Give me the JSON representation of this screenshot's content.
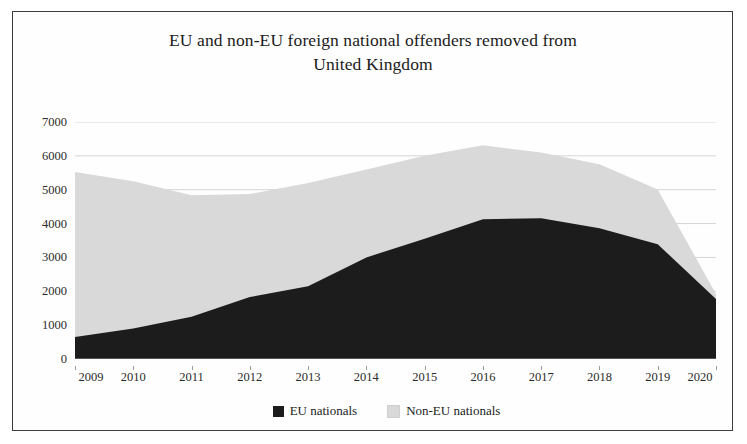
{
  "chart_data": {
    "type": "area",
    "stacked": true,
    "title": "EU and non-EU foreign national offenders removed from United Kingdom",
    "title_lines": [
      "EU and non-EU foreign national offenders removed from",
      "United Kingdom"
    ],
    "xlabel": "",
    "ylabel": "",
    "categories": [
      "2009",
      "2010",
      "2011",
      "2012",
      "2013",
      "2014",
      "2015",
      "2016",
      "2017",
      "2018",
      "2019",
      "2020"
    ],
    "x_tick_labels": [
      "2009",
      "2010",
      "2011",
      "2012",
      "2013",
      "2014",
      "2015",
      "2016",
      "2017",
      "2018",
      "2019",
      "2020"
    ],
    "y_tick_labels": [
      "0",
      "1000",
      "2000",
      "3000",
      "4000",
      "5000",
      "6000",
      "7000"
    ],
    "y_ticks": [
      0,
      1000,
      2000,
      3000,
      4000,
      5000,
      6000,
      7000
    ],
    "ylim": [
      0,
      7000
    ],
    "grid": true,
    "grid_axis": "y",
    "legend_position": "bottom",
    "series": [
      {
        "name": "EU nationals",
        "color": "#1c1c1c",
        "values": [
          650,
          900,
          1250,
          1830,
          2150,
          3000,
          3550,
          4130,
          4160,
          3860,
          3390,
          1770
        ]
      },
      {
        "name": "Non-EU nationals",
        "color": "#d9d9d9",
        "values": [
          4870,
          4350,
          3590,
          3040,
          3050,
          2600,
          2450,
          2180,
          1940,
          1890,
          1620,
          150
        ]
      }
    ],
    "totals": [
      5520,
      5250,
      4840,
      4870,
      5200,
      5600,
      6000,
      6310,
      6100,
      5750,
      5010,
      1920
    ]
  },
  "legend": {
    "items": [
      {
        "label": "EU nationals",
        "color": "#1c1c1c"
      },
      {
        "label": "Non-EU nationals",
        "color": "#d9d9d9"
      }
    ]
  }
}
